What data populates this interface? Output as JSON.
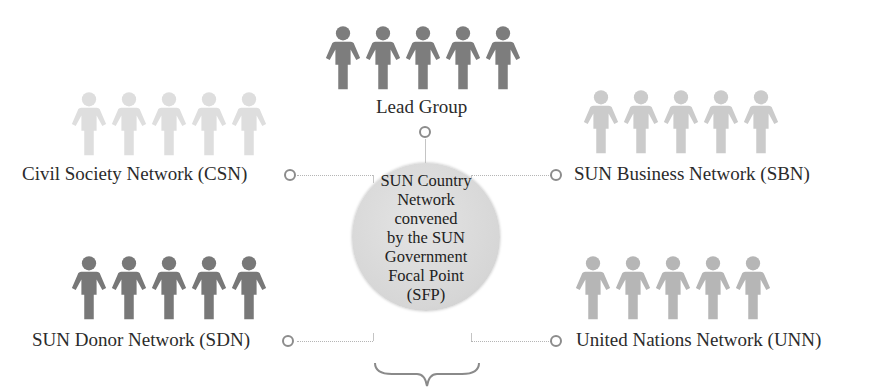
{
  "diagram": {
    "center": {
      "lines": [
        "SUN Country",
        "Network",
        "convened",
        "by the SUN",
        "Government",
        "Focal Point",
        "(SFP)"
      ]
    },
    "groups": [
      {
        "id": "lead",
        "label": "Lead Group",
        "color": "#7d7d7d",
        "people": 5
      },
      {
        "id": "csn",
        "label": "Civil Society Network (CSN)",
        "color": "#dcdcdc",
        "people": 5
      },
      {
        "id": "sbn",
        "label": "SUN Business Network (SBN)",
        "color": "#c8c8c8",
        "people": 5
      },
      {
        "id": "sdn",
        "label": "SUN Donor Network (SDN)",
        "color": "#777777",
        "people": 5
      },
      {
        "id": "unn",
        "label": "United Nations Network (UNN)",
        "color": "#b4b4b4",
        "people": 5
      }
    ]
  }
}
